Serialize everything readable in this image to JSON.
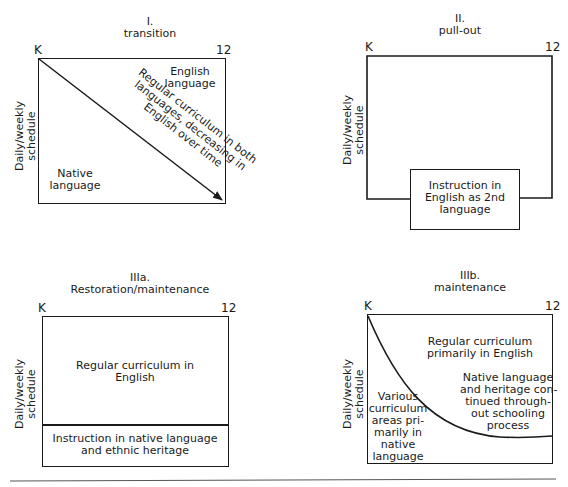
{
  "common": {
    "start_label": "K",
    "end_label": "12",
    "y_axis_label_line1": "Daily/weekly",
    "y_axis_label_line2": "schedule"
  },
  "panels": [
    {
      "id": "I",
      "numeral": "I.",
      "name": "transition",
      "regions": {
        "upper_right": [
          "English",
          "language"
        ],
        "lower_left": [
          "Native",
          "language"
        ],
        "diagonal_arrow_text": [
          "Regular curriculum in both",
          "languages, decreasing in",
          "English over time"
        ]
      }
    },
    {
      "id": "II",
      "numeral": "II.",
      "name": "pull-out",
      "regions": {
        "pull_out_box": [
          "Instruction in",
          "English as 2nd",
          "language"
        ]
      }
    },
    {
      "id": "IIIa",
      "numeral": "IIIa.",
      "name": "Restoration/maintenance",
      "regions": {
        "upper": [
          "Regular curriculum in",
          "English"
        ],
        "lower": [
          "Instruction in native language",
          "and ethnic heritage"
        ]
      }
    },
    {
      "id": "IIIb",
      "numeral": "IIIb.",
      "name": "maintenance",
      "regions": {
        "upper": [
          "Regular curriculum",
          "primarily in English"
        ],
        "right": [
          "Native language",
          "and heritage con-",
          "tinued through-",
          "out schooling",
          "process"
        ],
        "left": [
          "Various",
          "curriculum",
          "areas pri-",
          "marily in",
          "native",
          "language"
        ]
      }
    }
  ]
}
